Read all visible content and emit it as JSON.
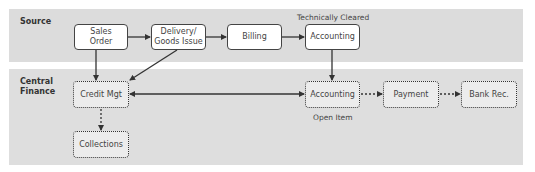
{
  "lanes": {
    "source": "Source",
    "central_line1": "Central",
    "central_line2": "Finance"
  },
  "source_nodes": {
    "sales_order_line1": "Sales",
    "sales_order_line2": "Order",
    "delivery_line1": "Delivery/",
    "delivery_line2": "Goods Issue",
    "billing": "Billing",
    "accounting": "Accounting"
  },
  "central_nodes": {
    "credit_mgt": "Credit Mgt",
    "collections": "Collections",
    "accounting": "Accounting",
    "payment": "Payment",
    "bank_rec": "Bank Rec."
  },
  "annotations": {
    "technically_cleared": "Technically Cleared",
    "open_item": "Open Item"
  },
  "colors": {
    "panel": "#dcdcdc",
    "solid_box": "#ffffff",
    "dotted_box": "#ececec",
    "stroke": "#333333"
  },
  "edges": [
    {
      "from": "Sales Order",
      "to": "Delivery/Goods Issue",
      "style": "solid"
    },
    {
      "from": "Delivery/Goods Issue",
      "to": "Billing",
      "style": "solid"
    },
    {
      "from": "Billing",
      "to": "Accounting (Source)",
      "style": "solid"
    },
    {
      "from": "Sales Order",
      "to": "Credit Mgt",
      "style": "solid"
    },
    {
      "from": "Delivery/Goods Issue",
      "to": "Credit Mgt",
      "style": "solid"
    },
    {
      "from": "Accounting (Source)",
      "to": "Accounting (Central)",
      "style": "solid"
    },
    {
      "from": "Credit Mgt",
      "to": "Accounting (Central)",
      "style": "solid",
      "bidirectional": true
    },
    {
      "from": "Credit Mgt",
      "to": "Collections",
      "style": "dotted"
    },
    {
      "from": "Accounting (Central)",
      "to": "Payment",
      "style": "dotted"
    },
    {
      "from": "Payment",
      "to": "Bank Rec.",
      "style": "dotted"
    }
  ]
}
